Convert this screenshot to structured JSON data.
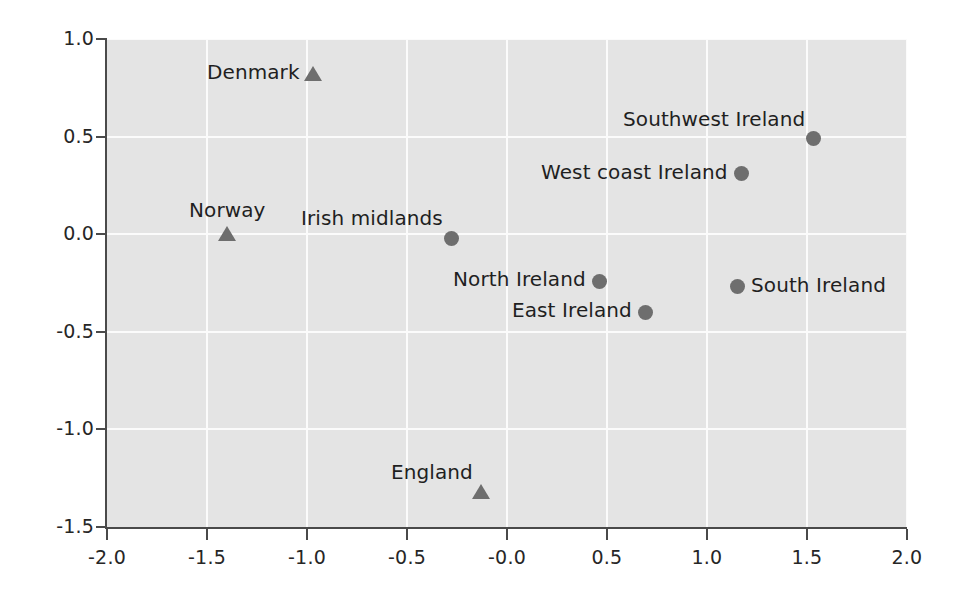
{
  "chart_data": {
    "type": "scatter",
    "title": "",
    "xlabel": "",
    "ylabel": "",
    "xlim": [
      -2.0,
      2.0
    ],
    "ylim": [
      -1.5,
      1.0
    ],
    "grid": true,
    "legend": "none",
    "xticks": [
      "-2.0",
      "-1.5",
      "-1.0",
      "-0.5",
      "-0.0",
      "0.5",
      "1.0",
      "1.5",
      "2.0"
    ],
    "xtick_values": [
      -2.0,
      -1.5,
      -1.0,
      -0.5,
      -0.0,
      0.5,
      1.0,
      1.5,
      2.0
    ],
    "yticks": [
      "1.0",
      "0.5",
      "0.0",
      "-0.5",
      "-1.0",
      "-1.5"
    ],
    "ytick_values": [
      1.0,
      0.5,
      0.0,
      -0.5,
      -1.0,
      -1.5
    ],
    "marker_color": "#6e6e6e",
    "plot_background": "#e4e4e4",
    "gridline_color": "#fbfbfb",
    "axis_color": "#4a4a4a",
    "series": [
      {
        "name": "Non-Irish populations",
        "marker": "triangle",
        "points": [
          {
            "label": "Denmark",
            "x": -0.97,
            "y": 0.82,
            "label_side": "left"
          },
          {
            "label": "Norway",
            "x": -1.4,
            "y": 0.0,
            "label_side": "above"
          },
          {
            "label": "England",
            "x": -0.13,
            "y": -1.32,
            "label_side": "above-left"
          }
        ]
      },
      {
        "name": "Irish populations",
        "marker": "circle",
        "points": [
          {
            "label": "Southwest Ireland",
            "x": 1.53,
            "y": 0.49,
            "label_side": "above-left"
          },
          {
            "label": "West coast Ireland",
            "x": 1.17,
            "y": 0.31,
            "label_side": "left"
          },
          {
            "label": "Irish midlands",
            "x": -0.28,
            "y": -0.02,
            "label_side": "above-left"
          },
          {
            "label": "North Ireland",
            "x": 0.46,
            "y": -0.24,
            "label_side": "left"
          },
          {
            "label": "East Ireland",
            "x": 0.69,
            "y": -0.4,
            "label_side": "left"
          },
          {
            "label": "South Ireland",
            "x": 1.15,
            "y": -0.27,
            "label_side": "right"
          }
        ]
      }
    ]
  }
}
